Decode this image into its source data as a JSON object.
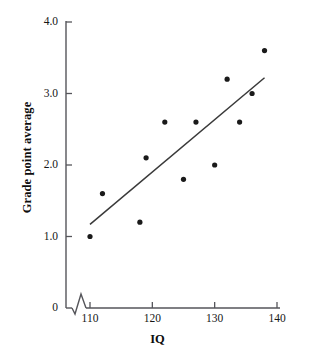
{
  "chart_data": {
    "type": "scatter",
    "title": "",
    "xlabel": "IQ",
    "ylabel": "Grade point average",
    "xlim": [
      110,
      140
    ],
    "ylim": [
      0,
      4.0
    ],
    "grid": false,
    "legend": null,
    "axis_break": {
      "axis": "x",
      "between": [
        0,
        110
      ],
      "symbol": "zigzag"
    },
    "xticks": [
      110,
      120,
      130,
      140
    ],
    "xtick_labels": [
      "110",
      "120",
      "130",
      "140"
    ],
    "yticks": [
      0,
      1.0,
      2.0,
      3.0,
      4.0
    ],
    "ytick_labels": [
      "0",
      "1.0",
      "2.0",
      "3.0",
      "4.0"
    ],
    "points": [
      {
        "x": 110,
        "y": 1.0
      },
      {
        "x": 112,
        "y": 1.6
      },
      {
        "x": 118,
        "y": 1.2
      },
      {
        "x": 119,
        "y": 2.1
      },
      {
        "x": 122,
        "y": 2.6
      },
      {
        "x": 125,
        "y": 1.8
      },
      {
        "x": 127,
        "y": 2.6
      },
      {
        "x": 130,
        "y": 2.0
      },
      {
        "x": 132,
        "y": 3.2
      },
      {
        "x": 134,
        "y": 2.6
      },
      {
        "x": 136,
        "y": 3.0
      },
      {
        "x": 138,
        "y": 3.6
      }
    ],
    "fit_line": {
      "name": "regression-line",
      "x_start": 110,
      "y_start": 1.17,
      "x_end": 138,
      "y_end": 3.22
    },
    "colors": {
      "marker": "#1a1a1a",
      "line": "#3a3a3a",
      "axis": "#55555a",
      "text": "#121212",
      "background": "#ffffff"
    }
  }
}
